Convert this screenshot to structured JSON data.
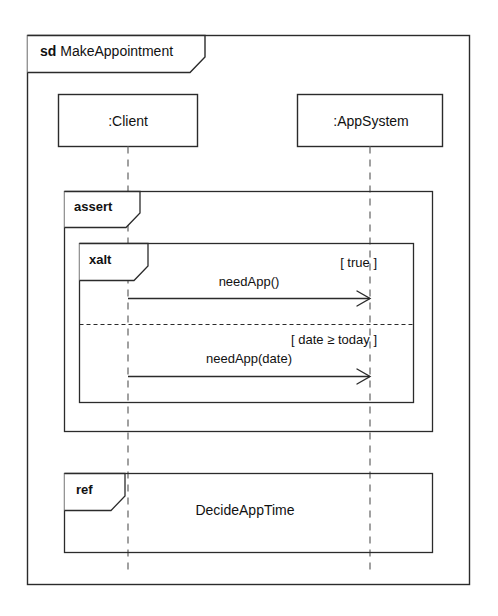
{
  "diagram": {
    "type": "uml-sequence-diagram",
    "frame": {
      "kind": "sd",
      "name": "MakeAppointment"
    },
    "lifelines": [
      {
        "id": "client",
        "label": ":Client"
      },
      {
        "id": "appsystem",
        "label": ":AppSystem"
      }
    ],
    "fragments": [
      {
        "id": "assert",
        "operator": "assert"
      },
      {
        "id": "xalt",
        "operator": "xalt",
        "operands": [
          {
            "guard": "[ true ]",
            "message": "needApp()"
          },
          {
            "guard": "[ date ≥ today ]",
            "message": "needApp(date)"
          }
        ]
      },
      {
        "id": "ref",
        "operator": "ref",
        "body": "DecideAppTime"
      }
    ],
    "messages": [
      {
        "name": "needApp()",
        "from": "client",
        "to": "appsystem",
        "arrow": "open"
      },
      {
        "name": "needApp(date)",
        "from": "client",
        "to": "appsystem",
        "arrow": "open"
      }
    ],
    "colors": {
      "stroke": "#2b2b2b",
      "background": "#ffffff",
      "text": "#111111"
    }
  }
}
